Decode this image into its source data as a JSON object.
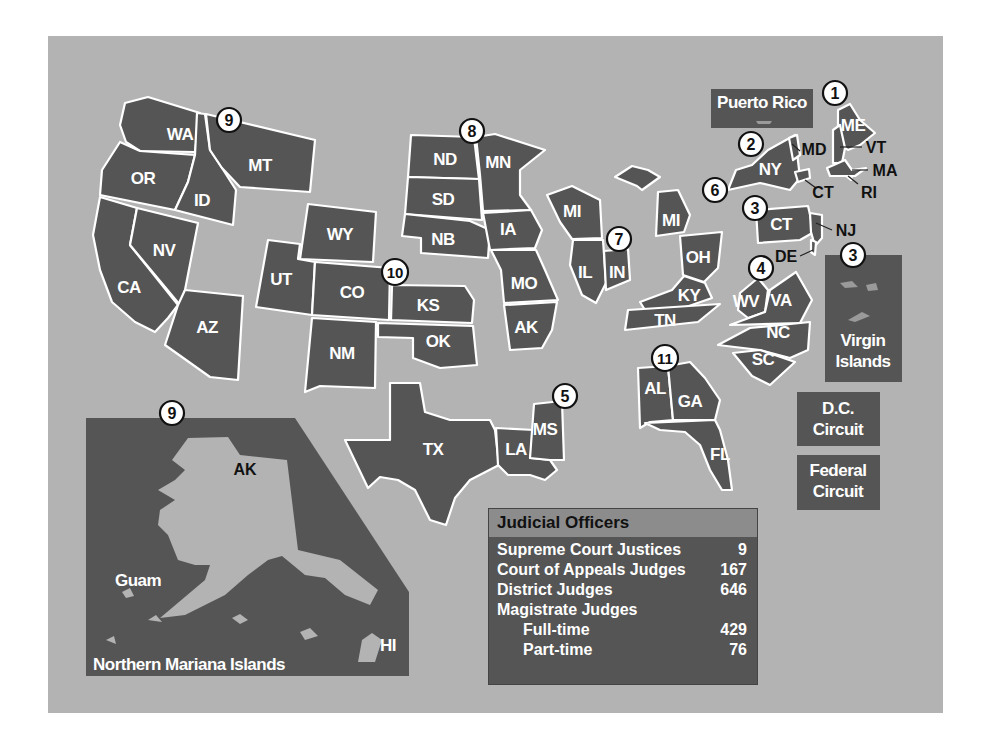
{
  "colors": {
    "background": "#ffffff",
    "panel": "#b3b3b3",
    "region_fill": "#555555",
    "border": "#ffffff",
    "table_header": "#8c8c8c"
  },
  "circuits": [
    {
      "number": "1",
      "states": [
        "ME",
        "VT",
        "MA",
        "RI"
      ],
      "territories": [
        "Puerto Rico"
      ]
    },
    {
      "number": "2",
      "states": [
        "NY",
        "MD",
        "CT"
      ]
    },
    {
      "number": "3",
      "states": [
        "CT",
        "NJ",
        "DE"
      ],
      "territories": [
        "Virgin Islands"
      ]
    },
    {
      "number": "4",
      "states": [
        "WV",
        "VA",
        "NC",
        "SC"
      ]
    },
    {
      "number": "5",
      "states": [
        "TX",
        "LA",
        "MS"
      ]
    },
    {
      "number": "6",
      "states": [
        "MI",
        "OH",
        "KY",
        "TN"
      ]
    },
    {
      "number": "7",
      "states": [
        "MI",
        "IL",
        "IN"
      ]
    },
    {
      "number": "8",
      "states": [
        "ND",
        "SD",
        "NB",
        "MN",
        "IA",
        "MO",
        "AK"
      ]
    },
    {
      "number": "9",
      "states": [
        "WA",
        "OR",
        "CA",
        "NV",
        "ID",
        "MT",
        "AZ",
        "AK",
        "HI"
      ],
      "territories": [
        "Guam",
        "Northern Mariana Islands"
      ]
    },
    {
      "number": "10",
      "states": [
        "WY",
        "UT",
        "CO",
        "KS",
        "OK",
        "NM"
      ]
    },
    {
      "number": "11",
      "states": [
        "AL",
        "GA",
        "FL"
      ]
    }
  ],
  "labels": {
    "WA": "WA",
    "OR": "OR",
    "CA": "CA",
    "NV": "NV",
    "ID": "ID",
    "MT": "MT",
    "AZ": "AZ",
    "WY": "WY",
    "UT": "UT",
    "CO": "CO",
    "NM": "NM",
    "KS": "KS",
    "OK": "OK",
    "ND": "ND",
    "SD": "SD",
    "NB": "NB",
    "MN": "MN",
    "IA": "IA",
    "MO": "MO",
    "AR": "AK",
    "WI": "MI",
    "IL": "IL",
    "IN": "IN",
    "MI": "MI",
    "OH": "OH",
    "KY": "KY",
    "TN": "TN",
    "TX": "TX",
    "LA": "LA",
    "MS": "MS",
    "AL": "AL",
    "GA": "GA",
    "FL": "FL",
    "WV": "WV",
    "VA": "VA",
    "NC": "NC",
    "SC": "SC",
    "PA": "CT",
    "NJ": "NJ",
    "DE": "DE",
    "NY": "NY",
    "MD": "MD",
    "CT": "CT",
    "ME": "ME",
    "VT": "VT",
    "MA": "MA",
    "RI": "RI",
    "AK": "AK",
    "HI": "HI",
    "Guam": "Guam",
    "NMI": "Northern Mariana Islands"
  },
  "circle_labels": {
    "c1": "1",
    "c2": "2",
    "c3a": "3",
    "c3b": "3",
    "c4": "4",
    "c5": "5",
    "c6": "6",
    "c7": "7",
    "c8": "8",
    "c9a": "9",
    "c9b": "9",
    "c10": "10",
    "c11": "11"
  },
  "boxes": {
    "puerto_rico": "Puerto Rico",
    "virgin_islands_line1": "Virgin",
    "virgin_islands_line2": "Islands",
    "dc_line1": "D.C.",
    "dc_line2": "Circuit",
    "federal_line1": "Federal",
    "federal_line2": "Circuit"
  },
  "judicial_officers": {
    "title": "Judicial Officers",
    "rows": [
      {
        "label": "Supreme Court Justices",
        "value": "9"
      },
      {
        "label": "Court of Appeals Judges",
        "value": "167"
      },
      {
        "label": "District Judges",
        "value": "646"
      },
      {
        "label": "Magistrate Judges",
        "value": ""
      },
      {
        "label": "Full-time",
        "value": "429"
      },
      {
        "label": "Part-time",
        "value": "76"
      }
    ]
  }
}
